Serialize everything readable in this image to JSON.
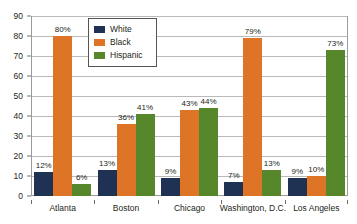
{
  "chart_data": {
    "type": "bar",
    "title": "",
    "subtitle": "",
    "xlabel": "",
    "ylabel": "",
    "categories": [
      "Atlanta",
      "Boston",
      "Chicago",
      "Washington, D.C.",
      "Los Angeles"
    ],
    "series": [
      {
        "name": "White",
        "color": "#1f3254",
        "values": [
          12,
          13,
          9,
          7,
          9
        ],
        "labels": [
          "12%",
          "13%",
          "9%",
          "7%",
          "9%"
        ]
      },
      {
        "name": "Black",
        "color": "#de7426",
        "values": [
          80,
          36,
          43,
          79,
          10
        ],
        "labels": [
          "80%",
          "36%",
          "43%",
          "79%",
          "10%"
        ]
      },
      {
        "name": "Hispanic",
        "color": "#56872b",
        "values": [
          6,
          41,
          44,
          13,
          73
        ],
        "labels": [
          "6%",
          "41%",
          "44%",
          "13%",
          "73%"
        ]
      }
    ],
    "ylim": [
      0,
      90
    ],
    "yticks": [
      0,
      10,
      20,
      30,
      40,
      50,
      60,
      70,
      80,
      90
    ],
    "ytick_labels": [
      "0",
      "10",
      "20",
      "30",
      "40",
      "50",
      "60",
      "70",
      "80",
      "90"
    ],
    "grid": true,
    "grid_axis": "y",
    "legend_position": "upper-left-inside",
    "legend_entries": [
      "White",
      "Black",
      "Hispanic"
    ],
    "value_labels_shown": true
  }
}
